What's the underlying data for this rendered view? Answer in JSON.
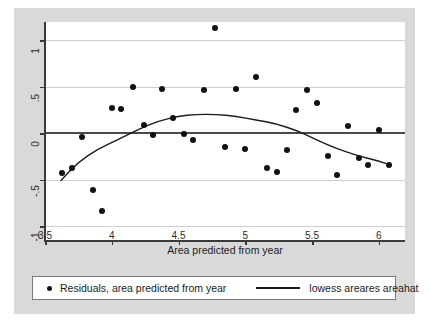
{
  "chart_data": {
    "type": "scatter",
    "title": "",
    "xlabel": "Area predicted from year",
    "ylabel": "",
    "xlim": [
      3.5,
      6.2
    ],
    "ylim": [
      -1.1,
      1.2
    ],
    "xticks": [
      "3.5",
      "4",
      "4.5",
      "5",
      "5.5",
      "6"
    ],
    "xtick_values": [
      3.5,
      4,
      4.5,
      5,
      5.5,
      6
    ],
    "yticks": [
      "1",
      ".5",
      "0",
      "-.5",
      "-1"
    ],
    "ytick_values": [
      1,
      0.5,
      0,
      -0.5,
      -1
    ],
    "grid": true,
    "legend_position": "bottom",
    "series": [
      {
        "name": "Residuals, area predicted from year",
        "type": "scatter",
        "marker": "circle",
        "color": "#111111",
        "points": [
          [
            3.63,
            -0.43
          ],
          [
            3.7,
            -0.38
          ],
          [
            3.78,
            -0.04
          ],
          [
            3.86,
            -0.61
          ],
          [
            3.93,
            -0.84
          ],
          [
            4.0,
            0.27
          ],
          [
            4.07,
            0.26
          ],
          [
            4.16,
            0.5
          ],
          [
            4.24,
            0.09
          ],
          [
            4.31,
            -0.02
          ],
          [
            4.38,
            0.47
          ],
          [
            4.46,
            0.16
          ],
          [
            4.54,
            -0.01
          ],
          [
            4.61,
            -0.07
          ],
          [
            4.69,
            0.46
          ],
          [
            4.77,
            1.13
          ],
          [
            4.85,
            -0.15
          ],
          [
            4.93,
            0.47
          ],
          [
            5.0,
            -0.17
          ],
          [
            5.08,
            0.6
          ],
          [
            5.16,
            -0.38
          ],
          [
            5.24,
            -0.42
          ],
          [
            5.31,
            -0.18
          ],
          [
            5.38,
            0.25
          ],
          [
            5.46,
            0.46
          ],
          [
            5.54,
            0.32
          ],
          [
            5.62,
            -0.25
          ],
          [
            5.69,
            -0.45
          ],
          [
            5.77,
            0.07
          ],
          [
            5.85,
            -0.27
          ],
          [
            5.92,
            -0.34
          ],
          [
            6.0,
            0.03
          ],
          [
            6.08,
            -0.34
          ]
        ]
      },
      {
        "name": "lowess areares areahat",
        "type": "line",
        "color": "#1c1c1c",
        "points": [
          [
            3.62,
            -0.51
          ],
          [
            3.75,
            -0.31
          ],
          [
            3.9,
            -0.17
          ],
          [
            4.05,
            -0.07
          ],
          [
            4.2,
            0.04
          ],
          [
            4.35,
            0.13
          ],
          [
            4.5,
            0.18
          ],
          [
            4.63,
            0.2
          ],
          [
            4.78,
            0.2
          ],
          [
            4.93,
            0.18
          ],
          [
            5.08,
            0.14
          ],
          [
            5.23,
            0.1
          ],
          [
            5.38,
            0.03
          ],
          [
            5.5,
            -0.05
          ],
          [
            5.62,
            -0.13
          ],
          [
            5.75,
            -0.2
          ],
          [
            5.88,
            -0.26
          ],
          [
            6.0,
            -0.3
          ],
          [
            6.08,
            -0.34
          ]
        ]
      }
    ]
  },
  "axis": {
    "x_title": "Area predicted from year"
  },
  "legend": {
    "points_label": "Residuals, area predicted from year",
    "line_label": "lowess areares areahat"
  },
  "colors": {
    "figure_background": "#d9d9d9",
    "plot_background": "#ffffff",
    "grid": "#cfcfcf",
    "zero_line": "#4a4a4a",
    "axis": "#3a3a3a",
    "marker": "#111111",
    "curve": "#1c1c1c"
  }
}
